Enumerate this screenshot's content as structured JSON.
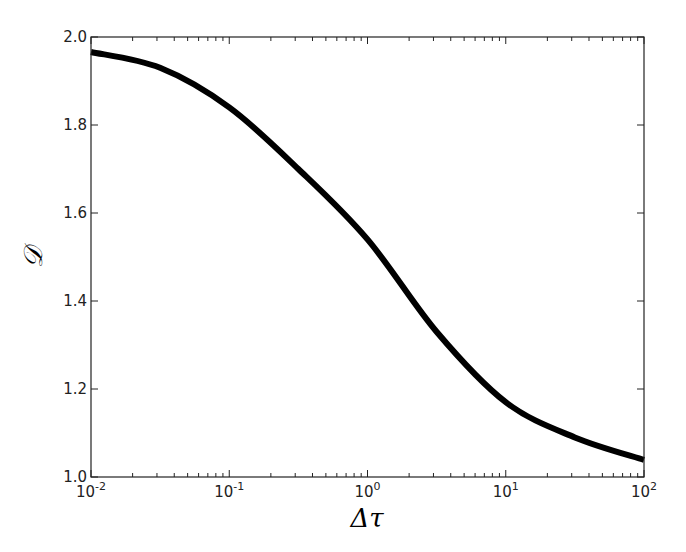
{
  "chart_data": {
    "type": "line",
    "title": "",
    "xlabel": "Δτ",
    "ylabel": "𝒟",
    "xscale": "log",
    "xlim": [
      0.01,
      100
    ],
    "ylim": [
      1.0,
      2.0
    ],
    "grid": false,
    "legend": null,
    "x_ticks": [
      {
        "value": 0.01,
        "base": "10",
        "exp": "-2"
      },
      {
        "value": 0.1,
        "base": "10",
        "exp": "-1"
      },
      {
        "value": 1,
        "base": "10",
        "exp": "0"
      },
      {
        "value": 10,
        "base": "10",
        "exp": "1"
      },
      {
        "value": 100,
        "base": "10",
        "exp": "2"
      }
    ],
    "y_ticks": [
      "1.0",
      "1.2",
      "1.4",
      "1.6",
      "1.8",
      "2.0"
    ],
    "series": [
      {
        "name": "D",
        "color": "#000000",
        "linewidth": 6,
        "x": [
          0.01,
          0.0316,
          0.1,
          0.316,
          1,
          3.16,
          10,
          31.6,
          100
        ],
        "y": [
          1.966,
          1.93,
          1.84,
          1.7,
          1.54,
          1.33,
          1.17,
          1.09,
          1.039
        ]
      }
    ]
  },
  "layout": {
    "plot_left": 91,
    "plot_right": 644,
    "plot_top": 37,
    "plot_bottom": 477
  }
}
